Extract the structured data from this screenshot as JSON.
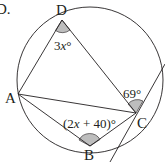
{
  "diagram": {
    "question_label": "D.",
    "type": "cyclic quadrilateral with tangent",
    "colors": {
      "stroke": "#231f20",
      "angle_fill": "#bdbdbd",
      "background": "#ffffff"
    },
    "points": {
      "A": {
        "label": "A"
      },
      "B": {
        "label": "B"
      },
      "C": {
        "label": "C"
      },
      "D": {
        "label": "D"
      }
    },
    "angles": {
      "D": {
        "coef": "3",
        "var": "x",
        "unit": "°"
      },
      "B": {
        "open": "(2",
        "var": "x",
        "rest": " + 40)°"
      },
      "tangent_C": {
        "text": "69°"
      }
    },
    "segments": [
      "DA",
      "DC",
      "AC",
      "AB",
      "BC"
    ],
    "tangent_at": "C"
  }
}
